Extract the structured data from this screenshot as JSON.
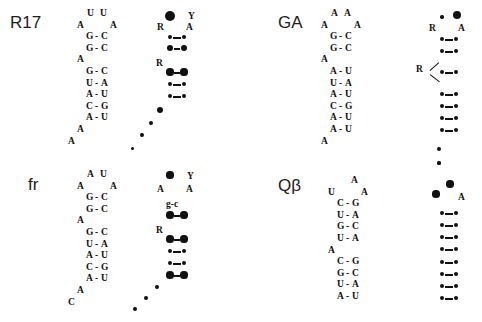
{
  "figure": {
    "background_color": "#ffffff",
    "ink_color": "#111111"
  },
  "panels": [
    {
      "id": "r17",
      "label": "R17",
      "label_pos": {
        "x": 10,
        "y": 13
      },
      "sequence": {
        "pos": {
          "x": 86,
          "y": 8
        },
        "rows": [
          {
            "type": "top",
            "left": "U",
            "right": "U"
          },
          {
            "type": "loop",
            "left": "A",
            "right": "A"
          },
          {
            "type": "pair",
            "left": "G",
            "dash": "-",
            "right": "C"
          },
          {
            "type": "pair",
            "left": "G",
            "dash": "-",
            "right": "C"
          },
          {
            "type": "bulge",
            "left": "A"
          },
          {
            "type": "pair",
            "left": "G",
            "dash": "-",
            "right": "C"
          },
          {
            "type": "pair",
            "left": "U",
            "dash": "-",
            "right": "A"
          },
          {
            "type": "pair",
            "left": "A",
            "dash": "-",
            "right": "U"
          },
          {
            "type": "pair",
            "left": "C",
            "dash": "-",
            "right": "G"
          },
          {
            "type": "pair",
            "left": "A",
            "dash": "-",
            "right": "U"
          },
          {
            "type": "tail",
            "left": "A"
          },
          {
            "type": "tail2",
            "left": "A"
          }
        ]
      },
      "dotmap": {
        "pos": {
          "x": 166,
          "y": 8
        },
        "labels": [
          {
            "text": "Y",
            "x": 22,
            "y": 3
          },
          {
            "text": "R",
            "x": -9,
            "y": 14
          },
          {
            "text": "A",
            "x": 20,
            "y": 14
          }
        ],
        "pointer": null,
        "nodes": [
          {
            "x": 4,
            "y": 8,
            "r": 5.4
          },
          {
            "x": 4,
            "y": 29,
            "r": 2.1
          },
          {
            "x": 18,
            "y": 29,
            "r": 2.1
          },
          {
            "x": 4,
            "y": 40,
            "r": 3.4
          },
          {
            "x": 18,
            "y": 40,
            "r": 3.4
          },
          {
            "x": 4,
            "y": 64,
            "r": 3.6
          },
          {
            "x": 18,
            "y": 64,
            "r": 3.6
          },
          {
            "x": 4,
            "y": 76,
            "r": 2.1
          },
          {
            "x": 18,
            "y": 76,
            "r": 2.1
          },
          {
            "x": 4,
            "y": 88,
            "r": 2.1
          },
          {
            "x": 18,
            "y": 88,
            "r": 2.1
          },
          {
            "x": -6,
            "y": 102,
            "r": 3.4
          },
          {
            "x": -15,
            "y": 115,
            "r": 2.1
          },
          {
            "x": -24,
            "y": 127,
            "r": 1.9
          },
          {
            "x": -34,
            "y": 140,
            "r": 1.5
          }
        ],
        "links": [
          {
            "x": 7,
            "y": 29,
            "w": 8
          },
          {
            "x": 8,
            "y": 40,
            "w": 6
          },
          {
            "x": 8,
            "y": 64,
            "w": 6
          },
          {
            "x": 7,
            "y": 76,
            "w": 8
          },
          {
            "x": 7,
            "y": 88,
            "w": 8
          }
        ],
        "extra_label": {
          "text": "R",
          "x": -10,
          "y": 50
        }
      }
    },
    {
      "id": "ga",
      "label": "GA",
      "label_pos": {
        "x": 278,
        "y": 13
      },
      "sequence": {
        "pos": {
          "x": 330,
          "y": 8
        },
        "rows": [
          {
            "type": "top",
            "left": "A",
            "right": "A"
          },
          {
            "type": "loop",
            "left": "A",
            "right": "A"
          },
          {
            "type": "pair",
            "left": "G",
            "dash": "-",
            "right": "C"
          },
          {
            "type": "pair",
            "left": "G",
            "dash": "-",
            "right": "C"
          },
          {
            "type": "bulge",
            "left": "A"
          },
          {
            "type": "pair",
            "left": "A",
            "dash": "-",
            "right": "U"
          },
          {
            "type": "pair",
            "left": "U",
            "dash": "-",
            "right": "A"
          },
          {
            "type": "pair",
            "left": "A",
            "dash": "-",
            "right": "U"
          },
          {
            "type": "pair",
            "left": "C",
            "dash": "-",
            "right": "G"
          },
          {
            "type": "pair",
            "left": "A",
            "dash": "-",
            "right": "U"
          },
          {
            "type": "pair",
            "left": "A",
            "dash": "-",
            "right": "U"
          },
          {
            "type": "tail",
            "left": "A"
          }
        ]
      },
      "dotmap": {
        "pos": {
          "x": 438,
          "y": 8
        },
        "labels": [
          {
            "text": "R",
            "x": -9,
            "y": 15
          },
          {
            "text": "A",
            "x": 20,
            "y": 15
          }
        ],
        "pointer": {
          "label": "R",
          "lx": -22,
          "ly": 56,
          "arms": [
            {
              "x": -8,
              "y": 62,
              "len": 12,
              "angle": -42
            },
            {
              "x": -8,
              "y": 66,
              "len": 12,
              "angle": 38
            }
          ]
        },
        "nodes": [
          {
            "x": 4,
            "y": 9,
            "r": 1.8
          },
          {
            "x": 19,
            "y": 7,
            "r": 4.0
          },
          {
            "x": 4,
            "y": 31,
            "r": 2.1
          },
          {
            "x": 18,
            "y": 31,
            "r": 2.1
          },
          {
            "x": 4,
            "y": 43,
            "r": 2.1
          },
          {
            "x": 18,
            "y": 43,
            "r": 2.1
          },
          {
            "x": 4,
            "y": 64,
            "r": 2.1
          },
          {
            "x": 18,
            "y": 64,
            "r": 2.1
          },
          {
            "x": 4,
            "y": 86,
            "r": 2.1
          },
          {
            "x": 18,
            "y": 86,
            "r": 2.1
          },
          {
            "x": 4,
            "y": 98,
            "r": 2.1
          },
          {
            "x": 18,
            "y": 98,
            "r": 2.1
          },
          {
            "x": 4,
            "y": 110,
            "r": 2.1
          },
          {
            "x": 18,
            "y": 110,
            "r": 2.1
          },
          {
            "x": 4,
            "y": 122,
            "r": 2.1
          },
          {
            "x": 18,
            "y": 122,
            "r": 2.1
          },
          {
            "x": 1,
            "y": 141,
            "r": 2.1
          },
          {
            "x": 1,
            "y": 155,
            "r": 1.6
          }
        ],
        "links": [
          {
            "x": 7,
            "y": 31,
            "w": 8
          },
          {
            "x": 7,
            "y": 43,
            "w": 8
          },
          {
            "x": 7,
            "y": 64,
            "w": 8
          },
          {
            "x": 7,
            "y": 86,
            "w": 8
          },
          {
            "x": 7,
            "y": 98,
            "w": 8
          },
          {
            "x": 7,
            "y": 110,
            "w": 8
          },
          {
            "x": 7,
            "y": 122,
            "w": 8
          }
        ],
        "extra_label": null
      }
    },
    {
      "id": "fr",
      "label": "fr",
      "label_pos": {
        "x": 28,
        "y": 175
      },
      "sequence": {
        "pos": {
          "x": 86,
          "y": 169
        },
        "rows": [
          {
            "type": "top",
            "left": "A",
            "right": "U"
          },
          {
            "type": "loop",
            "left": "A",
            "right": "A"
          },
          {
            "type": "pair",
            "left": "G",
            "dash": "-",
            "right": "C"
          },
          {
            "type": "pair",
            "left": "G",
            "dash": "-",
            "right": "C"
          },
          {
            "type": "bulge",
            "left": "A"
          },
          {
            "type": "pair",
            "left": "G",
            "dash": "-",
            "right": "C"
          },
          {
            "type": "pair",
            "left": "U",
            "dash": "-",
            "right": "A"
          },
          {
            "type": "pair",
            "left": "A",
            "dash": "-",
            "right": "U"
          },
          {
            "type": "pair",
            "left": "C",
            "dash": "-",
            "right": "G"
          },
          {
            "type": "pair",
            "left": "A",
            "dash": "-",
            "right": "U"
          },
          {
            "type": "tail",
            "left": "A"
          },
          {
            "type": "tail2",
            "left": "C"
          }
        ]
      },
      "dotmap": {
        "pos": {
          "x": 166,
          "y": 169
        },
        "labels": [
          {
            "text": "Y",
            "x": 21,
            "y": 2
          },
          {
            "text": "A",
            "x": -9,
            "y": 15
          },
          {
            "text": "A",
            "x": 20,
            "y": 15
          }
        ],
        "pointer": null,
        "letter_pair": {
          "left": "g",
          "dash": "-",
          "right": "c",
          "x": 0,
          "y": 30
        },
        "nodes": [
          {
            "x": 4,
            "y": 6,
            "r": 3.6
          },
          {
            "x": 4,
            "y": 46,
            "r": 3.6
          },
          {
            "x": 18,
            "y": 46,
            "r": 3.6
          },
          {
            "x": 4,
            "y": 70,
            "r": 3.6
          },
          {
            "x": 18,
            "y": 70,
            "r": 3.6
          },
          {
            "x": 4,
            "y": 82,
            "r": 2.1
          },
          {
            "x": 18,
            "y": 82,
            "r": 2.1
          },
          {
            "x": 4,
            "y": 94,
            "r": 2.1
          },
          {
            "x": 18,
            "y": 94,
            "r": 2.1
          },
          {
            "x": 4,
            "y": 106,
            "r": 3.6
          },
          {
            "x": 18,
            "y": 106,
            "r": 3.6
          },
          {
            "x": -9,
            "y": 118,
            "r": 1.9
          },
          {
            "x": -20,
            "y": 129,
            "r": 1.9
          },
          {
            "x": -31,
            "y": 140,
            "r": 1.9
          }
        ],
        "links": [
          {
            "x": 8,
            "y": 46,
            "w": 6
          },
          {
            "x": 8,
            "y": 70,
            "w": 6
          },
          {
            "x": 7,
            "y": 82,
            "w": 8
          },
          {
            "x": 7,
            "y": 94,
            "w": 8
          },
          {
            "x": 8,
            "y": 106,
            "w": 6
          }
        ],
        "extra_label": {
          "text": "R",
          "x": -10,
          "y": 56
        }
      }
    },
    {
      "id": "qbeta",
      "label": "Qβ",
      "label_pos": {
        "x": 278,
        "y": 176
      },
      "sequence": {
        "pos": {
          "x": 337,
          "y": 175
        },
        "rows": [
          {
            "type": "topsingle",
            "left": "A"
          },
          {
            "type": "loop",
            "left": "U",
            "right": "A"
          },
          {
            "type": "pair",
            "left": "C",
            "dash": "-",
            "right": "G"
          },
          {
            "type": "pair",
            "left": "U",
            "dash": "-",
            "right": "A"
          },
          {
            "type": "pair",
            "left": "G",
            "dash": "-",
            "right": "C"
          },
          {
            "type": "pair",
            "left": "U",
            "dash": "-",
            "right": "A"
          },
          {
            "type": "bulge",
            "left": "A"
          },
          {
            "type": "pair",
            "left": "C",
            "dash": "-",
            "right": "G"
          },
          {
            "type": "pair",
            "left": "G",
            "dash": "-",
            "right": "C"
          },
          {
            "type": "pair",
            "left": "U",
            "dash": "-",
            "right": "A"
          },
          {
            "type": "pair",
            "left": "A",
            "dash": "-",
            "right": "U"
          }
        ]
      },
      "dotmap": {
        "pos": {
          "x": 438,
          "y": 175
        },
        "labels": [
          {
            "text": "A",
            "x": 20,
            "y": 17
          }
        ],
        "pointer": null,
        "nodes": [
          {
            "x": 12,
            "y": 9,
            "r": 3.6
          },
          {
            "x": -2,
            "y": 19,
            "r": 3.6
          },
          {
            "x": 4,
            "y": 38,
            "r": 2.1
          },
          {
            "x": 18,
            "y": 38,
            "r": 2.1
          },
          {
            "x": 4,
            "y": 50,
            "r": 2.1
          },
          {
            "x": 18,
            "y": 50,
            "r": 2.1
          },
          {
            "x": 4,
            "y": 62,
            "r": 2.1
          },
          {
            "x": 18,
            "y": 62,
            "r": 2.1
          },
          {
            "x": 4,
            "y": 74,
            "r": 2.1
          },
          {
            "x": 18,
            "y": 74,
            "r": 2.1
          },
          {
            "x": 4,
            "y": 87,
            "r": 2.1
          },
          {
            "x": 18,
            "y": 87,
            "r": 2.1
          },
          {
            "x": 4,
            "y": 99,
            "r": 2.1
          },
          {
            "x": 18,
            "y": 99,
            "r": 2.1
          },
          {
            "x": 4,
            "y": 111,
            "r": 2.1
          },
          {
            "x": 18,
            "y": 111,
            "r": 2.1
          },
          {
            "x": 4,
            "y": 123,
            "r": 2.1
          },
          {
            "x": 18,
            "y": 123,
            "r": 2.1
          }
        ],
        "links": [
          {
            "x": 7,
            "y": 38,
            "w": 8
          },
          {
            "x": 7,
            "y": 50,
            "w": 8
          },
          {
            "x": 7,
            "y": 62,
            "w": 8
          },
          {
            "x": 7,
            "y": 74,
            "w": 8
          },
          {
            "x": 7,
            "y": 87,
            "w": 8
          },
          {
            "x": 7,
            "y": 99,
            "w": 8
          },
          {
            "x": 7,
            "y": 111,
            "w": 8
          },
          {
            "x": 7,
            "y": 123,
            "w": 8
          }
        ],
        "extra_label": null
      }
    }
  ]
}
